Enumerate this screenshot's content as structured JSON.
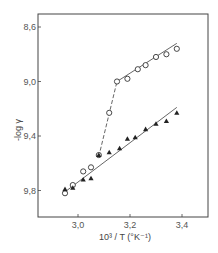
{
  "chart_data": {
    "type": "scatter",
    "title": "",
    "xlabel": "10³ / T  (°K⁻¹)",
    "ylabel": "-log γ",
    "xlim": [
      2.846,
      3.515
    ],
    "ylim": [
      8.5,
      10.1
    ],
    "y_inverted": true,
    "grid": false,
    "legend": null,
    "x_ticks": [
      3.0,
      3.2,
      3.4
    ],
    "x_tick_labels": [
      "3,0",
      "3,2",
      "3,4"
    ],
    "y_ticks": [
      8.6,
      9.0,
      9.4,
      9.8
    ],
    "y_tick_labels": [
      "8,6",
      "9,0",
      "9,4",
      "9,8"
    ],
    "series": [
      {
        "name": "open circles",
        "marker": "circle-open",
        "points": [
          {
            "x": 2.95,
            "y": 9.82
          },
          {
            "x": 2.98,
            "y": 9.76
          },
          {
            "x": 3.02,
            "y": 9.66
          },
          {
            "x": 3.05,
            "y": 9.63
          },
          {
            "x": 3.08,
            "y": 9.54
          },
          {
            "x": 3.12,
            "y": 9.23
          },
          {
            "x": 3.15,
            "y": 9.0
          },
          {
            "x": 3.19,
            "y": 8.98
          },
          {
            "x": 3.23,
            "y": 8.91
          },
          {
            "x": 3.26,
            "y": 8.88
          },
          {
            "x": 3.3,
            "y": 8.82
          },
          {
            "x": 3.34,
            "y": 8.8
          },
          {
            "x": 3.38,
            "y": 8.76
          }
        ]
      },
      {
        "name": "filled triangles",
        "marker": "triangle-filled",
        "points": [
          {
            "x": 2.95,
            "y": 9.79
          },
          {
            "x": 2.98,
            "y": 9.78
          },
          {
            "x": 3.02,
            "y": 9.72
          },
          {
            "x": 3.05,
            "y": 9.71
          },
          {
            "x": 3.08,
            "y": 9.54
          },
          {
            "x": 3.12,
            "y": 9.52
          },
          {
            "x": 3.16,
            "y": 9.49
          },
          {
            "x": 3.19,
            "y": 9.42
          },
          {
            "x": 3.22,
            "y": 9.41
          },
          {
            "x": 3.26,
            "y": 9.35
          },
          {
            "x": 3.3,
            "y": 9.31
          },
          {
            "x": 3.34,
            "y": 9.29
          },
          {
            "x": 3.38,
            "y": 9.23
          }
        ]
      }
    ],
    "fit_lines": [
      {
        "name": "upper solid fit",
        "style": "solid",
        "from": {
          "x": 3.15,
          "y": 9.0
        },
        "to": {
          "x": 3.38,
          "y": 8.72
        }
      },
      {
        "name": "dashed transition",
        "style": "dashed",
        "from": {
          "x": 3.08,
          "y": 9.55
        },
        "to": {
          "x": 3.15,
          "y": 9.0
        }
      },
      {
        "name": "lower solid fit",
        "style": "solid",
        "from": {
          "x": 2.95,
          "y": 9.81
        },
        "to": {
          "x": 3.38,
          "y": 9.19
        }
      }
    ],
    "plot_px": {
      "left": 38,
      "top": 14,
      "right": 208,
      "bottom": 217
    }
  }
}
